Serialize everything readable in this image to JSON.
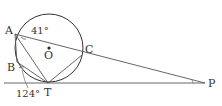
{
  "figure": {
    "type": "geometry-diagram",
    "points": {
      "A": {
        "label": "A",
        "x": 15,
        "y": 34
      },
      "B": {
        "label": "B",
        "x": 17,
        "y": 62
      },
      "C": {
        "label": "C",
        "x": 82,
        "y": 55
      },
      "T": {
        "label": "T",
        "x": 48,
        "y": 83
      },
      "P": {
        "label": "P",
        "x": 205,
        "y": 83
      },
      "O": {
        "label": "O",
        "x": 49,
        "y": 48
      }
    },
    "circle": {
      "cx": 49,
      "cy": 48,
      "r": 34
    },
    "angles": {
      "angle_at_A": "41°",
      "angle_at_B": "124°"
    },
    "segments": [
      "AP",
      "AB",
      "BT",
      "AT",
      "TC",
      "TP"
    ],
    "stroke_color": "#333333"
  }
}
